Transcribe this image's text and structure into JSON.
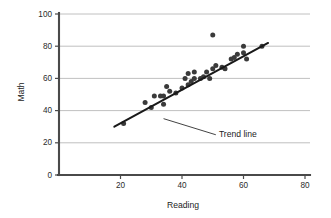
{
  "chart_data": {
    "type": "scatter",
    "title": "",
    "xlabel": "Reading",
    "ylabel": "Math",
    "xlim": [
      0,
      80
    ],
    "ylim": [
      0,
      100
    ],
    "xticks": [
      20,
      40,
      60,
      80
    ],
    "yticks": [
      0,
      20,
      40,
      60,
      80,
      100
    ],
    "grid": "horizontal",
    "legend": "none",
    "point_color": "#3a3a3a",
    "trend_color": "#191919",
    "grid_color": "#b9b9b9",
    "axis_color": "#4a4a4a",
    "points": [
      {
        "x": 21,
        "y": 32
      },
      {
        "x": 28,
        "y": 45
      },
      {
        "x": 30,
        "y": 42
      },
      {
        "x": 31,
        "y": 49
      },
      {
        "x": 33,
        "y": 49
      },
      {
        "x": 34,
        "y": 49
      },
      {
        "x": 34,
        "y": 44
      },
      {
        "x": 35,
        "y": 55
      },
      {
        "x": 36,
        "y": 52
      },
      {
        "x": 38,
        "y": 51
      },
      {
        "x": 40,
        "y": 54
      },
      {
        "x": 41,
        "y": 60
      },
      {
        "x": 42,
        "y": 56
      },
      {
        "x": 42,
        "y": 63
      },
      {
        "x": 43,
        "y": 58
      },
      {
        "x": 44,
        "y": 64
      },
      {
        "x": 44,
        "y": 60
      },
      {
        "x": 46,
        "y": 60
      },
      {
        "x": 47,
        "y": 61
      },
      {
        "x": 48,
        "y": 64
      },
      {
        "x": 49,
        "y": 60
      },
      {
        "x": 50,
        "y": 87
      },
      {
        "x": 50,
        "y": 66
      },
      {
        "x": 51,
        "y": 68
      },
      {
        "x": 53,
        "y": 67
      },
      {
        "x": 54,
        "y": 66
      },
      {
        "x": 56,
        "y": 72
      },
      {
        "x": 57,
        "y": 73
      },
      {
        "x": 58,
        "y": 75
      },
      {
        "x": 60,
        "y": 76
      },
      {
        "x": 60,
        "y": 80
      },
      {
        "x": 61,
        "y": 72
      },
      {
        "x": 66,
        "y": 80
      }
    ],
    "trend_line": {
      "label": "Trend line",
      "x1": 18,
      "y1": 30,
      "x2": 68,
      "y2": 82
    },
    "annotation": {
      "text": "Trend line",
      "text_x": 52,
      "text_y": 25,
      "leader_from_x": 34,
      "leader_from_y": 35,
      "leader_to_x": 51,
      "leader_to_y": 25
    }
  }
}
